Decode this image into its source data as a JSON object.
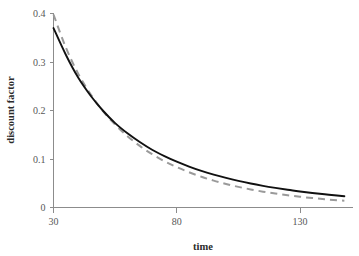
{
  "chart_data": {
    "type": "line",
    "title": "",
    "subtitle": "",
    "xlabel": "time",
    "ylabel": "discount factor",
    "xlim": [
      30,
      148
    ],
    "ylim": [
      0,
      0.4
    ],
    "xticks": [
      30,
      80,
      130
    ],
    "xtick_labels": [
      "30",
      "80",
      "130"
    ],
    "yticks": [
      0,
      0.1,
      0.2,
      0.3,
      0.4
    ],
    "ytick_labels": [
      "0",
      "0.1",
      "0.2",
      "0.3",
      "0.4"
    ],
    "grid": false,
    "legend": "none",
    "x": [
      30,
      35,
      40,
      45,
      50,
      55,
      60,
      65,
      70,
      75,
      80,
      85,
      90,
      95,
      100,
      105,
      110,
      115,
      120,
      125,
      130,
      135,
      140,
      145,
      148
    ],
    "series": [
      {
        "name": "solid-curve",
        "style": "solid",
        "color": "#111111",
        "values": [
          0.37,
          0.315,
          0.268,
          0.231,
          0.2,
          0.174,
          0.153,
          0.135,
          0.119,
          0.106,
          0.0945,
          0.0845,
          0.0755,
          0.0678,
          0.061,
          0.0549,
          0.0495,
          0.0447,
          0.0404,
          0.0365,
          0.0331,
          0.03,
          0.0272,
          0.0247,
          0.0233
        ]
      },
      {
        "name": "dashed-curve",
        "style": "dashed",
        "color": "#9a9a9a",
        "values": [
          0.398,
          0.33,
          0.276,
          0.234,
          0.199,
          0.171,
          0.147,
          0.127,
          0.11,
          0.0955,
          0.0832,
          0.0726,
          0.0634,
          0.0554,
          0.0485,
          0.0425,
          0.0373,
          0.0327,
          0.0287,
          0.0252,
          0.0222,
          0.0195,
          0.0171,
          0.0151,
          0.014
        ]
      }
    ]
  }
}
